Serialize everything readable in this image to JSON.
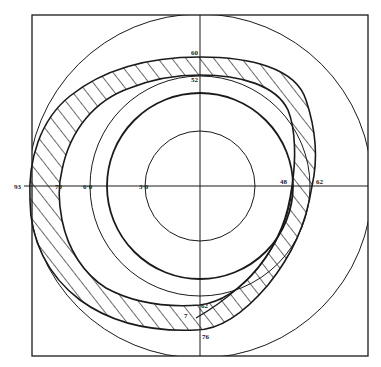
{
  "figure": {
    "type": "visual-field perimetry chart",
    "colors": {
      "ink": "#1a1a1a",
      "background": "#ffffff"
    },
    "reference_circles_deg": [
      30,
      60,
      90
    ],
    "axis_labels": {
      "top_outer": "60",
      "top_inner": "52",
      "left_far": "93",
      "left_isopter": "70",
      "left_60": "6·0",
      "left_30": "3·0",
      "right_inner": "48",
      "right_outer": "62",
      "bottom_inner": "62",
      "bottom_outer": "76",
      "bottom_mark": "7"
    },
    "shaded_region": "hatched zone between outer and inner isopters"
  }
}
